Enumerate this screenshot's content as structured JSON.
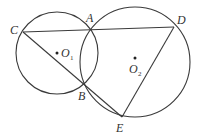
{
  "diagram": {
    "type": "geometry",
    "circles": [
      {
        "name": "O1",
        "center": [
          57,
          53
        ],
        "radius": 41
      },
      {
        "name": "O2",
        "center": [
          135,
          62
        ],
        "radius": 55
      }
    ],
    "points": {
      "A": [
        90,
        29
      ],
      "B": [
        82,
        85
      ],
      "C": [
        23,
        32
      ],
      "D": [
        174,
        27
      ],
      "E": [
        122,
        117
      ]
    },
    "segments": [
      [
        "C",
        "D"
      ],
      [
        "C",
        "E"
      ],
      [
        "D",
        "E"
      ]
    ],
    "labels": {
      "A": "A",
      "B": "B",
      "C": "C",
      "D": "D",
      "E": "E",
      "O1_main": "O",
      "O1_sub": "1",
      "O2_main": "O",
      "O2_sub": "2"
    },
    "colors": {
      "stroke": "#3a3a3a",
      "background": "#ffffff"
    }
  }
}
